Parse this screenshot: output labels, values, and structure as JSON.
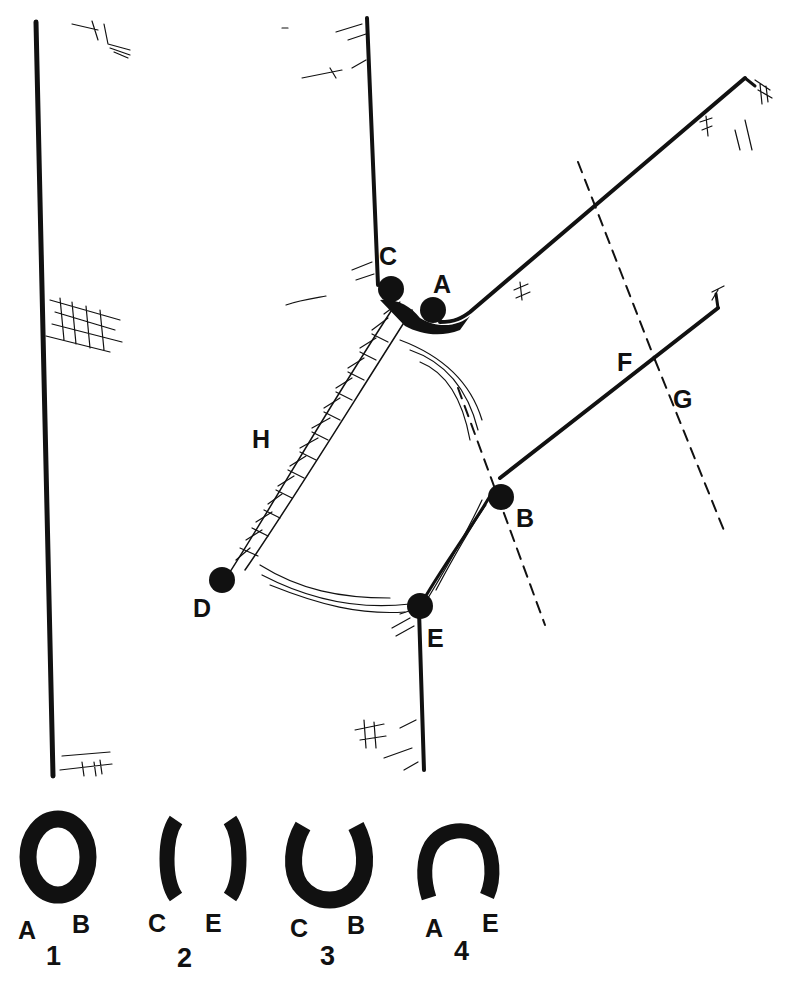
{
  "diagram": {
    "colors": {
      "ink": "#111111",
      "background": "#ffffff"
    },
    "trunk": {
      "left_edge": {
        "x1": 36,
        "y1": 22,
        "x2": 53,
        "y2": 776
      },
      "right_upper_edge": {
        "x1": 367,
        "y1": 18,
        "x2": 378,
        "y2": 285
      },
      "right_lower_edge": {
        "x1": 419,
        "y1": 610,
        "x2": 424,
        "y2": 770
      }
    },
    "branch": {
      "top_edge": {
        "x1": 455,
        "y1": 318,
        "x2": 745,
        "y2": 78
      },
      "bottom_edge": {
        "x1": 500,
        "y1": 478,
        "x2": 718,
        "y2": 308
      },
      "end_cap": {
        "x1": 718,
        "y1": 308,
        "x2": 718,
        "y2": 292
      }
    },
    "points": [
      {
        "id": "A",
        "label": "A",
        "cx": 433,
        "cy": 310,
        "lx": 433,
        "ly": 293
      },
      {
        "id": "B",
        "label": "B",
        "cx": 501,
        "cy": 497,
        "lx": 516,
        "ly": 527
      },
      {
        "id": "C",
        "label": "C",
        "cx": 391,
        "cy": 289,
        "lx": 379,
        "ly": 265
      },
      {
        "id": "D",
        "label": "D",
        "cx": 222,
        "cy": 580,
        "lx": 193,
        "ly": 617
      },
      {
        "id": "E",
        "label": "E",
        "cx": 420,
        "cy": 606,
        "lx": 427,
        "ly": 647
      }
    ],
    "line_labels": [
      {
        "id": "F",
        "label": "F",
        "x": 617,
        "y": 371
      },
      {
        "id": "G",
        "label": "G",
        "x": 673,
        "y": 408
      },
      {
        "id": "H",
        "label": "H",
        "x": 252,
        "y": 448
      }
    ],
    "dashed_lines": [
      {
        "name": "cut-line-AB",
        "x1": 458,
        "y1": 388,
        "x2": 545,
        "y2": 625
      },
      {
        "name": "cut-line-F",
        "x1": 578,
        "y1": 162,
        "x2": 655,
        "y2": 360
      },
      {
        "name": "cut-line-G",
        "x1": 655,
        "y1": 360,
        "x2": 725,
        "y2": 533
      }
    ],
    "cross_sections": [
      {
        "number": "1",
        "left_letter": "A",
        "right_letter": "B",
        "shape": "full-ring"
      },
      {
        "number": "2",
        "left_letter": "C",
        "right_letter": "E",
        "shape": "two-arcs"
      },
      {
        "number": "3",
        "left_letter": "C",
        "right_letter": "B",
        "shape": "u-ring"
      },
      {
        "number": "4",
        "left_letter": "A",
        "right_letter": "E",
        "shape": "n-ring"
      }
    ]
  }
}
